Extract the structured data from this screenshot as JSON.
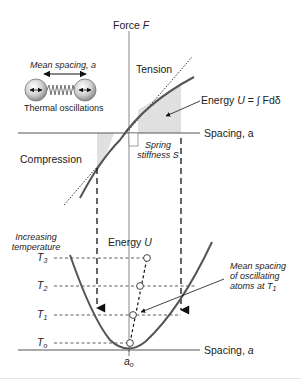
{
  "diagram": {
    "type": "physics-diagram",
    "upper_plot": {
      "y_axis_label": "Force",
      "y_axis_symbol": "F",
      "x_axis_label": "Spacing, a",
      "region_labels": {
        "tension": "Tension",
        "compression": "Compression"
      },
      "tangent_label_line1": "Spring",
      "tangent_label_line2": "stiffness S",
      "energy_label": "Energy ",
      "energy_symbol": "U",
      "energy_equation": " = ∫ Fdδ"
    },
    "inset": {
      "spacing_label": "Mean spacing, a",
      "caption": "Thermal oscillations"
    },
    "lower_plot": {
      "y_axis_label": "Energy ",
      "y_axis_symbol": "U",
      "x_axis_label": "Spacing, ",
      "x_axis_symbol": "a",
      "min_label": "a",
      "min_sub": "o",
      "temperature_heading_line1": "Increasing",
      "temperature_heading_line2": "temperature",
      "temperature_levels": [
        {
          "label": "T",
          "sub": "3"
        },
        {
          "label": "T",
          "sub": "2"
        },
        {
          "label": "T",
          "sub": "1"
        },
        {
          "label": "T",
          "sub": "o"
        }
      ],
      "annotation_line1": "Mean spacing",
      "annotation_line2": "of oscillating",
      "annotation_line3": "atoms at T",
      "annotation_sub": "1"
    },
    "colors": {
      "curve": "#555555",
      "axis": "#888888",
      "shade": "#e0e0e0",
      "text": "#222222"
    }
  }
}
